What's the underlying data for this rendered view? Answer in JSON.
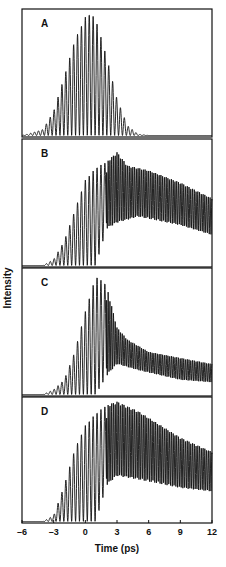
{
  "chart_data": {
    "type": "line",
    "title": "",
    "xlabel": "Time (ps)",
    "ylabel": "Intensity",
    "xlim": [
      -6,
      12
    ],
    "x_ticks": [
      -6,
      -3,
      0,
      3,
      6,
      9,
      12
    ],
    "x_tick_labels": [
      "–6",
      "–3",
      "0",
      "3",
      "6",
      "9",
      "12"
    ],
    "grid": false,
    "legend": null,
    "oscillation_period_ps": 0.37,
    "panels": [
      {
        "label": "A",
        "description": "Oscillating signal with symmetric Gaussian-like envelope centered near 0.5 ps",
        "upper_envelope": [
          [
            -6,
            0
          ],
          [
            -5.5,
            0.01
          ],
          [
            -4,
            0.05
          ],
          [
            -3,
            0.2
          ],
          [
            -2,
            0.48
          ],
          [
            -1,
            0.78
          ],
          [
            0,
            0.97
          ],
          [
            0.5,
            1.0
          ],
          [
            1,
            0.95
          ],
          [
            2,
            0.65
          ],
          [
            3,
            0.3
          ],
          [
            4,
            0.08
          ],
          [
            5,
            0.01
          ],
          [
            6,
            0
          ],
          [
            12,
            0
          ]
        ],
        "lower_envelope": [
          [
            -6,
            0
          ],
          [
            12,
            0
          ]
        ]
      },
      {
        "label": "B",
        "description": "Rise from -4 ps, peak near 3 ps, slow decay with dense oscillations to 12 ps",
        "upper_envelope": [
          [
            -6,
            0
          ],
          [
            -4,
            0
          ],
          [
            -3,
            0.05
          ],
          [
            -2,
            0.2
          ],
          [
            -1,
            0.45
          ],
          [
            0,
            0.7
          ],
          [
            1,
            0.8
          ],
          [
            2,
            0.85
          ],
          [
            3,
            0.93
          ],
          [
            4,
            0.82
          ],
          [
            6,
            0.78
          ],
          [
            9,
            0.68
          ],
          [
            12,
            0.55
          ]
        ],
        "lower_envelope": [
          [
            -6,
            0
          ],
          [
            1,
            0
          ],
          [
            2,
            0.3
          ],
          [
            3,
            0.35
          ],
          [
            5,
            0.4
          ],
          [
            9,
            0.33
          ],
          [
            12,
            0.25
          ]
        ]
      },
      {
        "label": "C",
        "description": "Rise from -4 ps, sharp peak near 1 ps, decay to low plateau with dense oscillations",
        "upper_envelope": [
          [
            -6,
            0
          ],
          [
            -4,
            0
          ],
          [
            -3,
            0.04
          ],
          [
            -2,
            0.12
          ],
          [
            -1,
            0.35
          ],
          [
            0,
            0.68
          ],
          [
            1,
            0.97
          ],
          [
            2,
            0.9
          ],
          [
            3,
            0.55
          ],
          [
            4,
            0.45
          ],
          [
            6,
            0.35
          ],
          [
            9,
            0.3
          ],
          [
            12,
            0.25
          ]
        ],
        "lower_envelope": [
          [
            -6,
            0
          ],
          [
            1,
            0
          ],
          [
            2,
            0.15
          ],
          [
            3,
            0.25
          ],
          [
            5,
            0.2
          ],
          [
            9,
            0.12
          ],
          [
            12,
            0.1
          ]
        ]
      },
      {
        "label": "D",
        "description": "Rise from -4 ps, peak near 3 ps, smooth linear-like decay with dense oscillations",
        "upper_envelope": [
          [
            -6,
            0
          ],
          [
            -4,
            0
          ],
          [
            -3,
            0.05
          ],
          [
            -2,
            0.3
          ],
          [
            -1,
            0.6
          ],
          [
            0,
            0.8
          ],
          [
            1,
            0.9
          ],
          [
            2,
            0.97
          ],
          [
            3,
            1.0
          ],
          [
            5,
            0.92
          ],
          [
            9,
            0.7
          ],
          [
            12,
            0.58
          ]
        ],
        "lower_envelope": [
          [
            -6,
            0
          ],
          [
            1,
            0
          ],
          [
            2,
            0.3
          ],
          [
            3,
            0.38
          ],
          [
            5,
            0.35
          ],
          [
            9,
            0.28
          ],
          [
            12,
            0.25
          ]
        ]
      }
    ]
  },
  "layout": {
    "plot_left": 22,
    "plot_right": 212,
    "panel_tops": [
      9,
      139,
      268,
      397
    ],
    "panel_bottoms": [
      137,
      267,
      396,
      523
    ],
    "line_color": "#111111"
  }
}
